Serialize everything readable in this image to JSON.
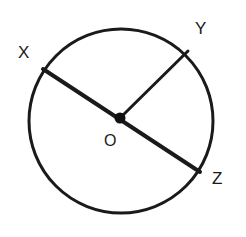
{
  "figure": {
    "name": "circle-with-radii-diagram",
    "type": "geometry-diagram",
    "background_color": "#ffffff",
    "stroke_color": "#1a1a1a",
    "circle": {
      "center_label": "O",
      "center_x": 121,
      "center_y": 121,
      "radius": 92,
      "stroke_width": 3
    },
    "center_dot": {
      "x": 120,
      "y": 118,
      "radius": 5,
      "fill": "#111111"
    },
    "points": [
      {
        "label": "X",
        "x": 43,
        "y": 69,
        "label_x": 18,
        "label_y": 44
      },
      {
        "label": "Y",
        "x": 188,
        "y": 51,
        "label_x": 195,
        "label_y": 20
      },
      {
        "label": "Z",
        "x": 200,
        "y": 172,
        "label_x": 212,
        "label_y": 170
      }
    ],
    "segments": [
      {
        "name": "diameter-XZ",
        "from": "X",
        "to": "Z",
        "x1": 43,
        "y1": 69,
        "x2": 200,
        "y2": 172,
        "kind": "diameter",
        "stroke_width": 4
      },
      {
        "name": "radius-OY",
        "from": "O",
        "to": "Y",
        "x1": 120,
        "y1": 118,
        "x2": 188,
        "y2": 51,
        "kind": "radius",
        "stroke_width": 3
      }
    ],
    "labels": {
      "x": "X",
      "y": "Y",
      "z": "Z",
      "o": "O"
    }
  }
}
